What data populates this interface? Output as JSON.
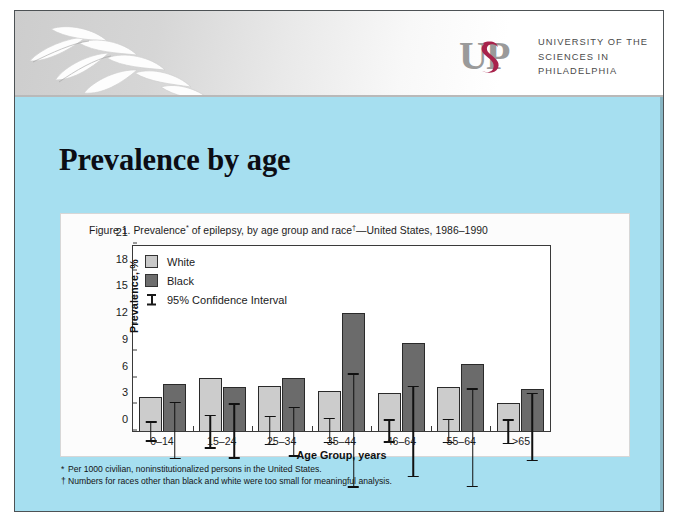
{
  "slide": {
    "title": "Prevalence by age",
    "page_number": "19",
    "background_color": "#a6dff0",
    "header_gradient": [
      "#cdcdcd",
      "#ffffff"
    ]
  },
  "branding": {
    "logo_mark_text": "USP",
    "logo_letters": [
      "U",
      "S",
      "P"
    ],
    "logo_accent_color": "#a8234b",
    "logo_gray_color": "#8d8d8d",
    "logo_icon_name": "usp-monogram-icon",
    "institution_lines": [
      "UNIVERSITY OF THE",
      "SCIENCES IN",
      "PHILADELPHIA"
    ],
    "decoration_icon_name": "laurel-branch-icon"
  },
  "figure": {
    "caption_prefix": "Figure 1. Prevalence",
    "caption_mark_1": "*",
    "caption_middle": " of epilepsy, by age group and race",
    "caption_mark_2": "†",
    "caption_suffix": "—United States, 1986–1990",
    "caption_full": "Figure 1. Prevalence* of epilepsy, by age group and race†—United States, 1986–1990",
    "footnotes": [
      {
        "marker": "*",
        "text": "Per 1000 civilian, noninstitutionalized persons in the United States."
      },
      {
        "marker": "†",
        "text": "Numbers for races other than black and white were too small for meaningful analysis."
      }
    ]
  },
  "chart_data": {
    "type": "bar",
    "title": "Figure 1. Prevalence* of epilepsy, by age group and race†—United States, 1986–1990",
    "xlabel": "Age Group, years",
    "ylabel": "Prevalence, %",
    "ylim": [
      0,
      21
    ],
    "yticks": [
      0,
      3,
      6,
      9,
      12,
      15,
      18,
      21
    ],
    "ytick_labels": [
      "0",
      "3",
      "6",
      "9",
      "12",
      "15",
      "18",
      "21"
    ],
    "grid": false,
    "legend_position": "inside-top-left",
    "error_bars": "95% Confidence Interval",
    "categories": [
      "0–14",
      "15–24",
      "25–34",
      "35–44",
      "46–64",
      "55–64",
      ">65"
    ],
    "series": [
      {
        "name": "White",
        "color": "#cccccc",
        "values": [
          3.8,
          6.0,
          5.1,
          4.5,
          4.3,
          4.9,
          3.2
        ],
        "ci_low": [
          2.6,
          4.0,
          3.5,
          3.1,
          3.0,
          3.5,
          1.7
        ],
        "ci_high": [
          4.9,
          7.8,
          6.8,
          6.0,
          5.6,
          6.3,
          4.5
        ]
      },
      {
        "name": "Black",
        "color": "#6b6b6b",
        "values": [
          5.3,
          4.9,
          5.9,
          13.3,
          9.9,
          7.5,
          4.7
        ],
        "ci_low": [
          2.1,
          1.8,
          3.0,
          6.9,
          4.7,
          1.2,
          1.3
        ],
        "ci_high": [
          8.6,
          8.0,
          8.6,
          19.8,
          15.0,
          12.3,
          9.0
        ]
      }
    ],
    "legend": [
      {
        "label": "White",
        "swatch": "light-gray"
      },
      {
        "label": "Black",
        "swatch": "dark-gray"
      },
      {
        "label": "95% Confidence Interval",
        "swatch": "i-bar"
      }
    ]
  }
}
